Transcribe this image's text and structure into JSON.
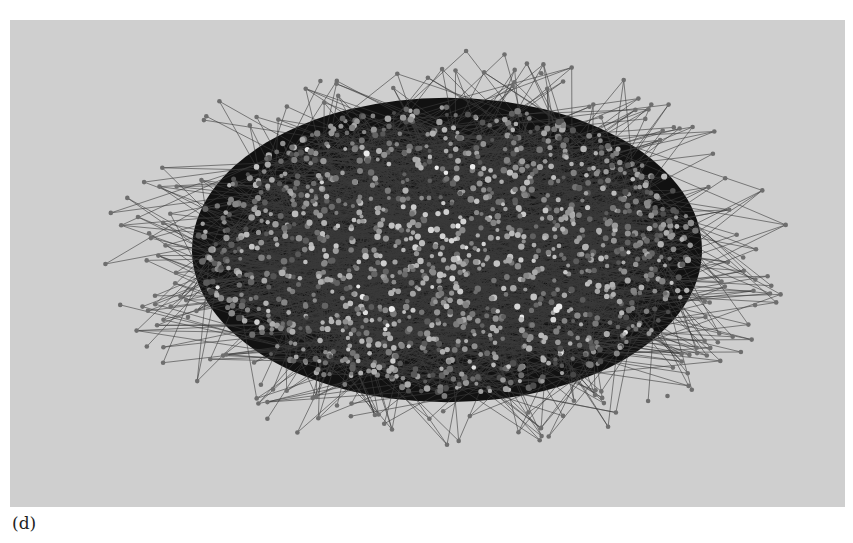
{
  "figure": {
    "panel_label": "(d)",
    "type": "network-graph",
    "colors": {
      "background": "#cfcfcf",
      "edge": "#3a3a3a",
      "node_outer": "#6e6e6e",
      "node_core_dark": "#111111",
      "node_highlight": "#e8e8e8"
    },
    "layout": {
      "center": [
        447,
        250
      ],
      "radius_x": 250,
      "radius_y": 145,
      "outlier_radius_x": 330,
      "outlier_radius_y": 195
    },
    "counts": {
      "core_nodes": 1400,
      "peripheral_nodes": 170,
      "edges": 2200
    }
  }
}
